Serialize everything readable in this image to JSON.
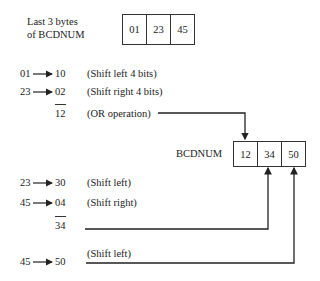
{
  "source": {
    "label_line1": "Last 3 bytes",
    "label_line2": "of BCDNUM",
    "bytes": [
      "01",
      "23",
      "45"
    ]
  },
  "result": {
    "label": "BCDNUM",
    "bytes": [
      "12",
      "34",
      "50"
    ]
  },
  "steps": [
    {
      "from": "01",
      "to": "10",
      "op": "(Shift left 4 bits)"
    },
    {
      "from": "23",
      "to": "02",
      "op": "(Shift right 4 bits)"
    },
    {
      "result": "12",
      "op": "(OR operation)"
    },
    {
      "from": "23",
      "to": "30",
      "op": "(Shift left)"
    },
    {
      "from": "45",
      "to": "04",
      "op": "(Shift right)"
    },
    {
      "result": "34"
    },
    {
      "from": "45",
      "to": "50",
      "op": "(Shift left)"
    }
  ],
  "icons": {
    "arrow": "right-arrow-icon"
  }
}
